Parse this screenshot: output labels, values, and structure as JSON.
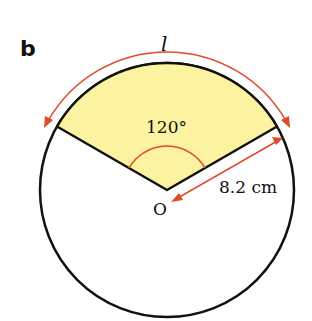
{
  "panel_label": "b",
  "arc_label": "l",
  "angle_label": "120°",
  "center_label": "O",
  "radius_label": "8.2 cm",
  "colors": {
    "sector_fill": "#fbf3a0",
    "outline": "#111111",
    "annotation": "#e04a2c"
  },
  "geometry": {
    "angle_deg": 120,
    "radius_cm": 8.2
  }
}
